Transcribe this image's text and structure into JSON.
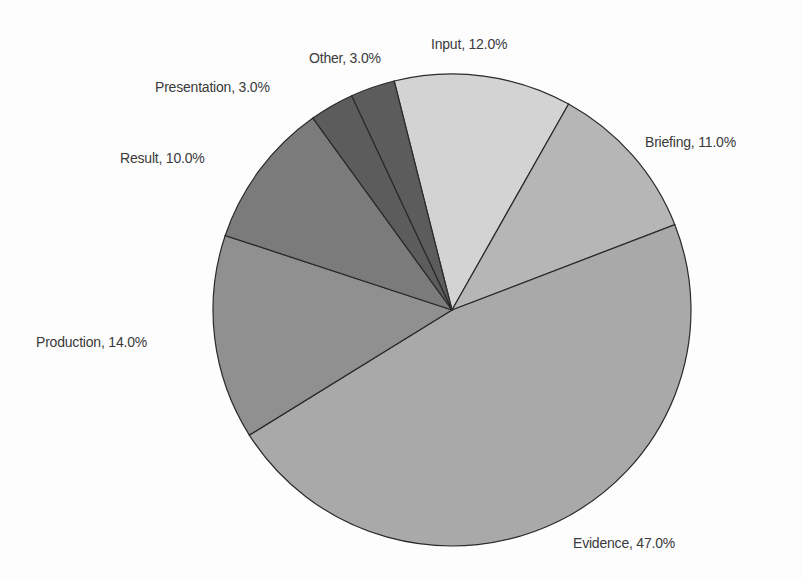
{
  "chart_data": {
    "type": "pie",
    "title": "",
    "categories": [
      "Input",
      "Briefing",
      "Evidence",
      "Production",
      "Result",
      "Presentation",
      "Other"
    ],
    "values": [
      12.0,
      11.0,
      47.0,
      14.0,
      10.0,
      3.0,
      3.0
    ],
    "unit": "%",
    "labels": [
      "Input, 12.0%",
      "Briefing, 11.0%",
      "Evidence, 47.0%",
      "Production, 14.0%",
      "Result, 10.0%",
      "Presentation, 3.0%",
      "Other, 3.0%"
    ],
    "colors": [
      "#d3d3d3",
      "#b6b6b6",
      "#a9a9a9",
      "#909090",
      "#7b7b7b",
      "#5c5c5c",
      "#5c5c5c"
    ],
    "legend": "none (data labels placed outside slices)"
  }
}
